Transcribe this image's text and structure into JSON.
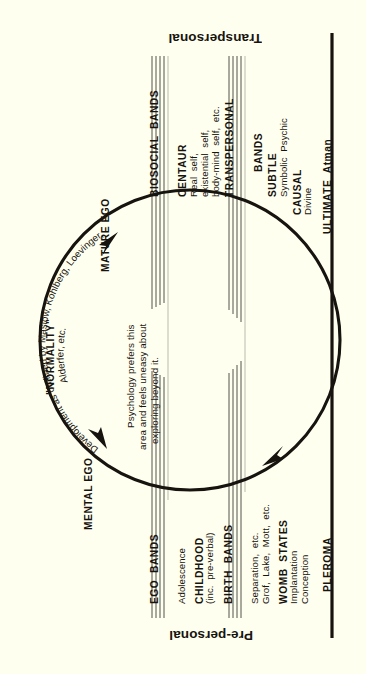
{
  "figure": {
    "background_color": "#fffff0",
    "ink_color": "#17140f",
    "orientation": "sideways (body text reads bottom-to-top)"
  },
  "zones": {
    "transpersonal": "Transpersonal",
    "prepersonal": "Pre-personal"
  },
  "arc_labels": {
    "normality": "\"NORMALITY\"",
    "mature_ego": "MATURE EGO",
    "mental_ego": "MENTAL EGO",
    "development_curve_line1": "Development as outlined by Maslow, Kohlberg, Loevinger,",
    "development_curve_line2": "Alderfer, etc.",
    "note_line1": "Psychology prefers this",
    "note_line2": "area and feels uneasy about",
    "note_line3": "exploring beyond it."
  },
  "upper_bands": [
    {
      "name": "biosocial-bands",
      "label": "BIOSOCIAL  BANDS",
      "rules": 4,
      "items": []
    },
    {
      "name": "centaur",
      "label": "CENTAUR",
      "rules": 0,
      "items": [
        "Real  self,",
        "existential  self,",
        "body-mind  self,  etc."
      ]
    },
    {
      "name": "transpersonal-bands",
      "label": "TRANSPERSONAL",
      "sublabel": "BANDS",
      "rules": 4,
      "items": []
    },
    {
      "name": "subtle",
      "label": "SUBTLE",
      "rules": 0,
      "items": [
        "Symbolic  Psychic"
      ]
    },
    {
      "name": "causal",
      "label": "CAUSAL",
      "rules": 0,
      "items": [
        "Divine"
      ]
    },
    {
      "name": "ultimate",
      "label": "ULTIMATE  Atman",
      "rules": 0,
      "items": []
    }
  ],
  "lower_bands": [
    {
      "name": "ego-bands",
      "label": "EGO  BANDS",
      "rules": 4,
      "items": []
    },
    {
      "name": "adolescence",
      "label": "Adolescence",
      "rules": 0,
      "items": []
    },
    {
      "name": "childhood",
      "label": "CHILDHOOD",
      "sublabel": "(inc.  pre-verbal)",
      "rules": 0,
      "items": []
    },
    {
      "name": "birth-bands",
      "label": "BIRTH  BANDS",
      "rules": 4,
      "items": [
        "Separation,  etc.",
        "Grof,  Lake,  Mott,  etc."
      ]
    },
    {
      "name": "womb-states",
      "label": "WOMB  STATES",
      "rules": 0,
      "items": [
        "Implantation",
        "Conception"
      ]
    },
    {
      "name": "pleroma",
      "label": "PLEROMA",
      "rules": 0,
      "items": []
    }
  ],
  "arrows": [
    {
      "name": "arrow-upper-left",
      "direction": "counter-clockwise toward MATURE EGO"
    },
    {
      "name": "arrow-lower-left",
      "direction": "counter-clockwise toward MENTAL EGO"
    },
    {
      "name": "arrow-lower-right",
      "direction": "counter-clockwise toward PLEROMA side"
    }
  ],
  "geometry": {
    "circle_center_x": 190,
    "circle_center_y": 340,
    "circle_radius": 150,
    "axis_line_x": 332,
    "axis_line_top": 33,
    "axis_line_bottom": 638
  }
}
